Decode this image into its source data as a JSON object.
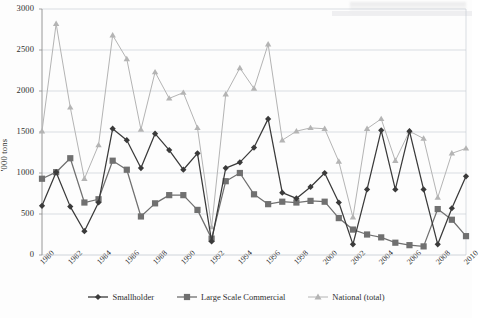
{
  "figure": {
    "ylabel": "'000 tons",
    "ytick_labels": [
      "0",
      "500",
      "1000",
      "1500",
      "2000",
      "2500",
      "3000"
    ],
    "xtick_labels": [
      "1980",
      "1982",
      "1984",
      "1986",
      "1988",
      "1990",
      "1992",
      "1994",
      "1996",
      "1998",
      "2000",
      "2002",
      "2004",
      "2006",
      "2008",
      "2010"
    ]
  },
  "legend": {
    "items": [
      {
        "label": "Smallholder",
        "marker": "diamond",
        "color": "#3a3a3a"
      },
      {
        "label": "Large Scale Commercial",
        "marker": "square",
        "color": "#707070"
      },
      {
        "label": "National (total)",
        "marker": "triangle",
        "color": "#b4b4b4"
      }
    ]
  },
  "chart_data": {
    "type": "line",
    "title": "",
    "xlabel": "",
    "ylabel": "'000 tons",
    "ylim": [
      0,
      3000
    ],
    "ytick_step": 500,
    "grid": true,
    "legend_position": "bottom",
    "x": [
      1980,
      1981,
      1982,
      1983,
      1984,
      1985,
      1986,
      1987,
      1988,
      1989,
      1990,
      1991,
      1992,
      1993,
      1994,
      1995,
      1996,
      1997,
      1998,
      1999,
      2000,
      2001,
      2002,
      2003,
      2004,
      2005,
      2006,
      2007,
      2008,
      2009,
      2010
    ],
    "categories": [
      "1980",
      "1981",
      "1982",
      "1983",
      "1984",
      "1985",
      "1986",
      "1987",
      "1988",
      "1989",
      "1990",
      "1991",
      "1992",
      "1993",
      "1994",
      "1995",
      "1996",
      "1997",
      "1998",
      "1999",
      "2000",
      "2001",
      "2002",
      "2003",
      "2004",
      "2005",
      "2006",
      "2007",
      "2008",
      "2009",
      "2010"
    ],
    "series": [
      {
        "name": "Smallholder",
        "color": "#3a3a3a",
        "marker": "diamond",
        "values": [
          600,
          1010,
          590,
          290,
          640,
          1540,
          1400,
          1060,
          1480,
          1280,
          1040,
          1240,
          165,
          1060,
          1130,
          1310,
          1660,
          760,
          690,
          830,
          1000,
          640,
          130,
          800,
          1520,
          800,
          1510,
          800,
          130,
          570,
          960
        ]
      },
      {
        "name": "Large Scale Commercial",
        "color": "#707070",
        "marker": "square",
        "values": [
          930,
          1010,
          1180,
          640,
          680,
          1150,
          1040,
          470,
          630,
          730,
          730,
          550,
          200,
          900,
          1000,
          740,
          620,
          650,
          640,
          660,
          650,
          450,
          310,
          250,
          215,
          150,
          120,
          105,
          560,
          430,
          230
        ]
      },
      {
        "name": "National (total)",
        "color": "#b4b4b4",
        "marker": "triangle",
        "values": [
          1510,
          2820,
          1800,
          930,
          1340,
          2680,
          2390,
          1530,
          2230,
          1910,
          1980,
          1550,
          340,
          1960,
          2280,
          2030,
          2570,
          1400,
          1510,
          1550,
          1540,
          1140,
          460,
          1540,
          1660,
          1150,
          1510,
          1420,
          700,
          1240,
          1300
        ]
      }
    ]
  }
}
